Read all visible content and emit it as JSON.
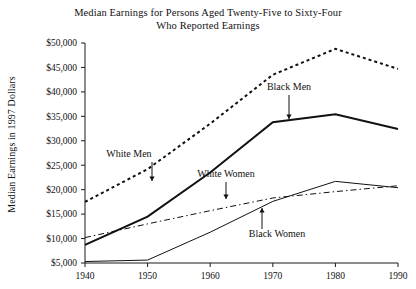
{
  "chart_data": {
    "type": "line",
    "title": "Median Earnings for Persons Aged Twenty-Five to Sixty-Four Who Reported Earnings",
    "title_line_1": "Median Earnings for Persons Aged Twenty-Five to Sixty-Four",
    "title_line_2": "Who Reported Earnings",
    "xlabel": "",
    "ylabel": "Median Earnings in 1997 Dollars",
    "x": [
      1940,
      1950,
      1960,
      1970,
      1980,
      1990
    ],
    "xtick_labels": [
      "1940",
      "1950",
      "1960",
      "1970",
      "1980",
      "1990"
    ],
    "xlim": [
      1940,
      1990
    ],
    "ylim": [
      5000,
      50000
    ],
    "ytick_values": [
      5000,
      10000,
      15000,
      20000,
      25000,
      30000,
      35000,
      40000,
      45000,
      50000
    ],
    "ytick_labels": [
      "$5,000",
      "$10,000",
      "$15,000",
      "$20,000",
      "$25,000",
      "$30,000",
      "$35,000",
      "$40,000",
      "$45,000",
      "$50,000"
    ],
    "grid": false,
    "legend": "annotations",
    "series": [
      {
        "name": "White Men",
        "style": "dashed",
        "stroke_width": 2,
        "dasharray": "3,3",
        "values": [
          17500,
          24200,
          33500,
          43500,
          48800,
          44700
        ]
      },
      {
        "name": "Black Men",
        "style": "solid-thick",
        "stroke_width": 2,
        "dasharray": "",
        "values": [
          8700,
          14500,
          23500,
          33800,
          35400,
          32400
        ]
      },
      {
        "name": "White Women",
        "style": "dash-dot",
        "stroke_width": 1,
        "dasharray": "6,3,1.5,3",
        "values": [
          10200,
          13000,
          15700,
          18300,
          19600,
          20800
        ]
      },
      {
        "name": "Black Women",
        "style": "solid-thin",
        "stroke_width": 1,
        "dasharray": "",
        "values": [
          5300,
          5600,
          11300,
          17600,
          21700,
          20400
        ]
      }
    ],
    "annotations": [
      {
        "label": "White Men",
        "series": "White Men",
        "text_x": 129,
        "text_y": 157,
        "arrow_x": 152,
        "arrow_y1": 162,
        "arrow_y2": 181,
        "direction": "down"
      },
      {
        "label": "Black Men",
        "series": "Black Men",
        "text_x": 289,
        "text_y": 90,
        "arrow_x": 289,
        "arrow_y1": 95,
        "arrow_y2": 119,
        "direction": "down"
      },
      {
        "label": "White Women",
        "series": "White Women",
        "text_x": 226,
        "text_y": 177,
        "arrow_x": 226,
        "arrow_y1": 182,
        "arrow_y2": 199,
        "direction": "down"
      },
      {
        "label": "Black Women",
        "series": "Black Women",
        "text_x": 277,
        "text_y": 237,
        "arrow_x": 262,
        "arrow_y1": 229,
        "arrow_y2": 208,
        "direction": "up"
      }
    ],
    "colors": {
      "ink": "#111111",
      "background": "#ffffff"
    }
  }
}
